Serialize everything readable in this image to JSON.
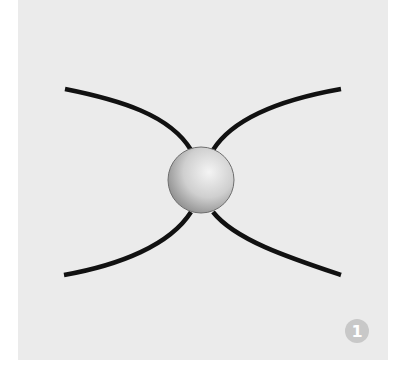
{
  "diagram": {
    "background_color": "#ebebeb",
    "line_color": "#111111",
    "sphere": {
      "cx": 201,
      "cy": 180,
      "r": 33,
      "highlight": "#f4f4f4",
      "shadow": "#8a8a8a"
    },
    "curves": [
      "M65,89 C120,100 170,115 191,150",
      "M341,89 C290,98 235,115 213,150",
      "M64,275 C120,265 170,245 191,212",
      "M341,275 C290,258 235,240 213,212"
    ],
    "badge": {
      "label": "1",
      "color": "#c8c8c8",
      "text_color": "#ffffff"
    }
  }
}
